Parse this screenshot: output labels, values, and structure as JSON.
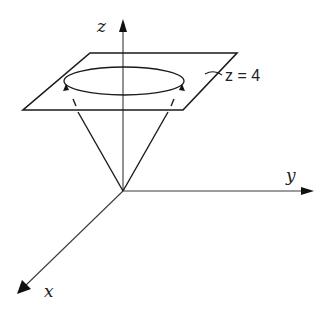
{
  "diagram": {
    "type": "3d-cone-with-plane",
    "axes": {
      "x_label": "x",
      "y_label": "y",
      "z_label": "z"
    },
    "plane_label": "z = 4",
    "colors": {
      "background": "#ffffff",
      "stroke": "#1a1a1a",
      "axis": "#3a3a3a"
    }
  }
}
